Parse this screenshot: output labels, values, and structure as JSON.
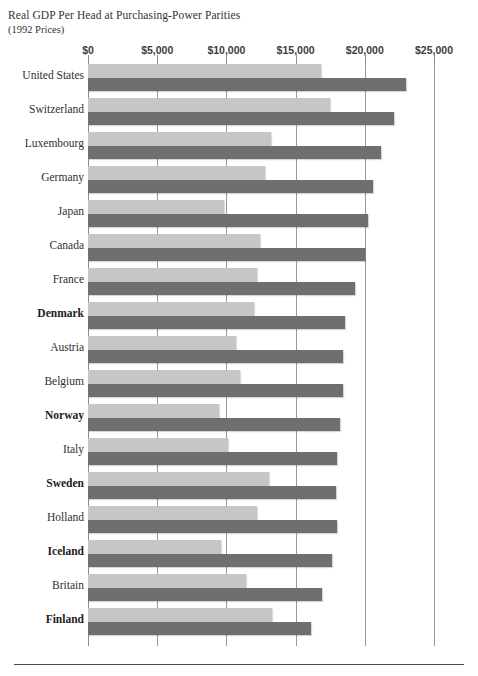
{
  "chart_data": {
    "type": "bar",
    "orientation": "horizontal",
    "title": "Real GDP Per Head at Purchasing-Power Parities",
    "subtitle": "(1992 Prices)",
    "xlabel": "",
    "ylabel": "",
    "xlim": [
      0,
      25000
    ],
    "grid": true,
    "legend_position": "none",
    "tick_labels": [
      "$0",
      "$5,000",
      "$10,000",
      "$15,000",
      "$20,000",
      "$25,000"
    ],
    "tick_values": [
      0,
      5000,
      10000,
      15000,
      20000,
      25000
    ],
    "categories": [
      "United States",
      "Switzerland",
      "Luxembourg",
      "Germany",
      "Japan",
      "Canada",
      "France",
      "Denmark",
      "Austria",
      "Belgium",
      "Norway",
      "Italy",
      "Sweden",
      "Holland",
      "Iceland",
      "Britain",
      "Finland"
    ],
    "highlighted_categories": [
      "Denmark",
      "Norway",
      "Sweden",
      "Iceland",
      "Finland"
    ],
    "series": [
      {
        "name": "light",
        "color": "#c6c6c6",
        "values": [
          16800,
          17500,
          13200,
          12800,
          9800,
          12400,
          12200,
          12000,
          10700,
          11000,
          9500,
          10100,
          13100,
          12200,
          9600,
          11400,
          13300
        ]
      },
      {
        "name": "dark",
        "color": "#6f6f6f",
        "values": [
          23000,
          22100,
          21200,
          20600,
          20200,
          20000,
          19300,
          18600,
          18400,
          18400,
          18200,
          18000,
          17900,
          18000,
          17600,
          16900,
          16100
        ]
      }
    ]
  }
}
